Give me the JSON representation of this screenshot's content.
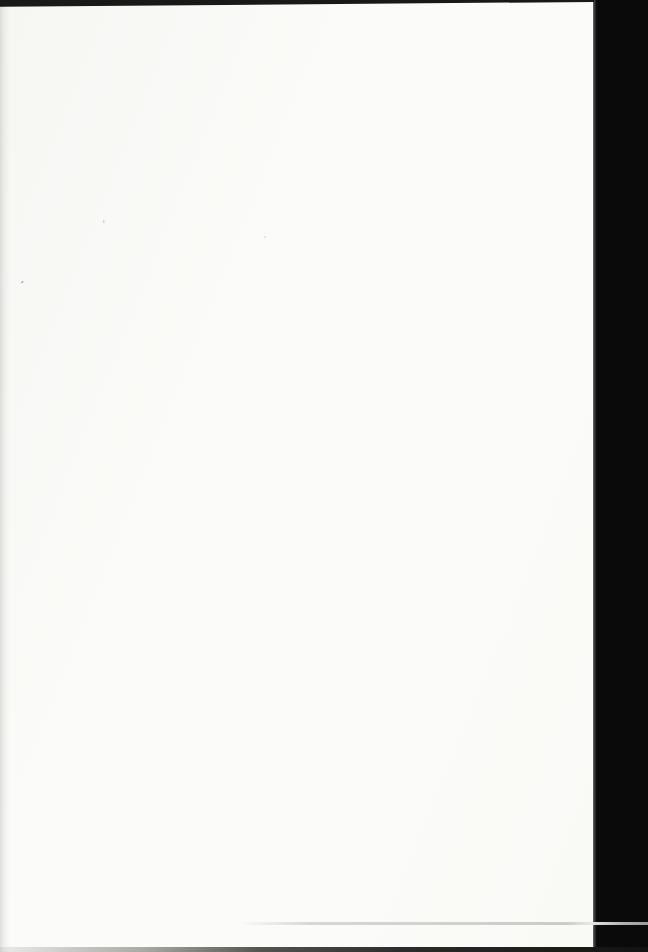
{
  "scan": {
    "colors": {
      "scan_black": "#0a0a0a",
      "page_color": "#fbfbf9",
      "top_edge_color": "#191919",
      "bottom_edge_color": "#2c2c2c",
      "edge_line_color": "#b8b8b8"
    },
    "marks": [
      {
        "name": "stray-apostrophe-mark",
        "glyph": "′"
      },
      {
        "name": "faint-tick-mark",
        "glyph": "ˈ"
      },
      {
        "name": "faint-speck-mark",
        "glyph": "·"
      }
    ]
  }
}
